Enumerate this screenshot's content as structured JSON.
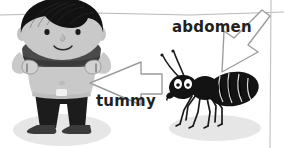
{
  "page": {
    "width": 284,
    "height": 148,
    "background_color": "#ffffff"
  },
  "colors": {
    "skin": "#c9c9c9",
    "skin_shadow": "#b0b0b0",
    "hair": "#111111",
    "shirt": "#4a4a4a",
    "shirt_dark": "#3a3a3a",
    "pants": "#1a1a1a",
    "ant_body": "#151515",
    "shadow": "#e3e3e3",
    "arrow_outline": "#9a9a9a",
    "arrow_fill": "#ffffff",
    "text": "#231f20",
    "rule_line": "#b8b8b8"
  },
  "labels": {
    "tummy": {
      "text": "tummy",
      "target": "boy-belly"
    },
    "abdomen": {
      "text": "abdomen",
      "target": "ant-abdomen"
    }
  },
  "figures": {
    "boy": {
      "name": "cartoon-boy",
      "description": "Smiling boy with black bowl-cut hair lifting his grey shirt to show his tummy, wearing dark trousers, standing on a grey oval shadow",
      "parts": [
        "hair",
        "face",
        "eyes",
        "nose",
        "smile",
        "ears",
        "shirt",
        "arms",
        "hands",
        "belly",
        "navel",
        "legs",
        "feet",
        "shadow"
      ]
    },
    "ant": {
      "name": "cartoon-ant",
      "description": "Black cartoon ant facing left with two antennae, large white eyes, head, thorax, striped abdomen, six legs, standing on a grey oval shadow",
      "parts": [
        "antennae",
        "head",
        "eyes",
        "mandible",
        "thorax",
        "abdomen",
        "legs",
        "shadow"
      ]
    }
  },
  "arrows": {
    "tummy_arrow": {
      "name": "arrow-pointing-left",
      "direction": "left",
      "style": "white outlined block arrow"
    },
    "abdomen_arrow": {
      "name": "arrow-pointing-down-left",
      "direction": "down-left",
      "style": "white outlined block arrow"
    }
  },
  "decorations": {
    "top_rule": "horizontal thin grey rule across the top of the page",
    "right_rule": "vertical thin grey rule near the right edge of the page"
  },
  "icon_names": {
    "tummy_arrow_icon": "arrow-left-icon",
    "abdomen_arrow_icon": "arrow-down-left-icon"
  }
}
